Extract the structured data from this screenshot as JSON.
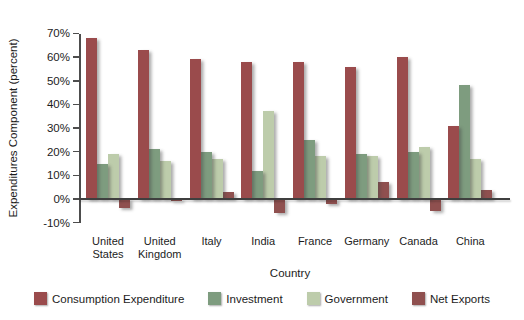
{
  "chart_data": {
    "type": "bar",
    "title": "",
    "xlabel": "Country",
    "ylabel": "Expenditures Component (percent)",
    "categories": [
      "United States",
      "United Kingdom",
      "Italy",
      "India",
      "France",
      "Germany",
      "Canada",
      "China"
    ],
    "series": [
      {
        "name": "Consumption Expenditure",
        "color": "#9a4b4c",
        "values": [
          68,
          63,
          59,
          58,
          58,
          56,
          60,
          31
        ]
      },
      {
        "name": "Investment",
        "color": "#7e9c7f",
        "values": [
          15,
          21,
          20,
          12,
          25,
          19,
          20,
          48
        ]
      },
      {
        "name": "Government",
        "color": "#bdccab",
        "values": [
          19,
          16,
          17,
          37,
          18,
          18,
          22,
          17
        ]
      },
      {
        "name": "Net Exports",
        "color": "#8f504f",
        "values": [
          -4,
          -1,
          3,
          -6,
          -2,
          7,
          -5,
          4
        ]
      }
    ],
    "ylim": [
      -10,
      70
    ],
    "y_tick_step": 10,
    "y_tick_labels": [
      "70%",
      "60%",
      "50%",
      "40%",
      "30%",
      "20%",
      "10%",
      "0%",
      "-10%"
    ],
    "grid": false,
    "legend_position": "bottom"
  },
  "colors": {
    "background": "#ffffff",
    "axis": "#4d4d4d",
    "text": "#1c1c1c"
  }
}
